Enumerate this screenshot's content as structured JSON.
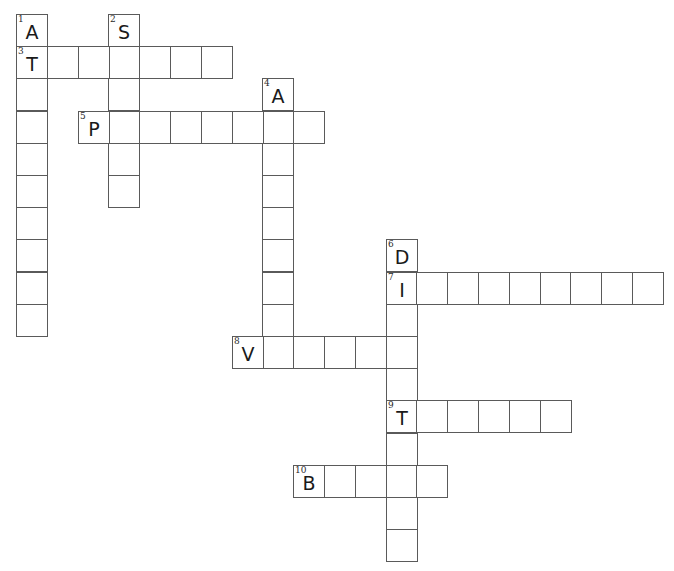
{
  "puzzle": {
    "grid": {
      "origin_x": 16,
      "origin_y": 14,
      "col_pitch": 30.8,
      "row_pitch": 32.2,
      "line_color": "#5a5a5a",
      "text_color": "#1a1a1a"
    },
    "entries": [
      {
        "number": "1",
        "direction": "down",
        "row": 0,
        "col": 0,
        "length": 10,
        "given_letter": "A"
      },
      {
        "number": "2",
        "direction": "down",
        "row": 0,
        "col": 3,
        "length": 6,
        "given_letter": "S"
      },
      {
        "number": "3",
        "direction": "across",
        "row": 1,
        "col": 0,
        "length": 7,
        "given_letter": "T"
      },
      {
        "number": "4",
        "direction": "down",
        "row": 2,
        "col": 8,
        "length": 9,
        "given_letter": "A"
      },
      {
        "number": "5",
        "direction": "across",
        "row": 3,
        "col": 2,
        "length": 8,
        "given_letter": "P"
      },
      {
        "number": "6",
        "direction": "down",
        "row": 7,
        "col": 12,
        "length": 10,
        "given_letter": "D"
      },
      {
        "number": "7",
        "direction": "across",
        "row": 8,
        "col": 12,
        "length": 9,
        "given_letter": "I"
      },
      {
        "number": "8",
        "direction": "across",
        "row": 10,
        "col": 7,
        "length": 6,
        "given_letter": "V"
      },
      {
        "number": "9",
        "direction": "across",
        "row": 12,
        "col": 12,
        "length": 6,
        "given_letter": "T"
      },
      {
        "number": "10",
        "direction": "across",
        "row": 14,
        "col": 9,
        "length": 5,
        "given_letter": "B"
      }
    ]
  }
}
